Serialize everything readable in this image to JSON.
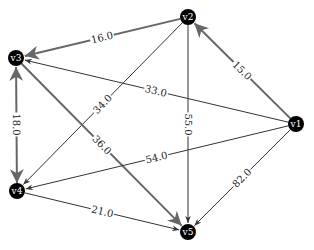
{
  "diagram": {
    "type": "directed-weighted-graph",
    "colors": {
      "node_fill": "#000000",
      "node_text": "#ffffff",
      "thin_edge": "#333333",
      "thick_edge": "#666666",
      "label_bg": "#ffffff"
    },
    "nodes": [
      {
        "id": "v1",
        "label": "v1",
        "x": 296,
        "y": 124
      },
      {
        "id": "v2",
        "label": "v2",
        "x": 188,
        "y": 17
      },
      {
        "id": "v3",
        "label": "v3",
        "x": 16,
        "y": 58
      },
      {
        "id": "v4",
        "label": "v4",
        "x": 17,
        "y": 191
      },
      {
        "id": "v5",
        "label": "v5",
        "x": 188,
        "y": 232
      }
    ],
    "edges": [
      {
        "from": "v2",
        "to": "v3",
        "weight": "16.0",
        "style": "thick"
      },
      {
        "from": "v1",
        "to": "v2",
        "weight": "15.0",
        "style": "thick"
      },
      {
        "from": "v1",
        "to": "v3",
        "weight": "33.0",
        "style": "thin"
      },
      {
        "from": "v2",
        "to": "v4",
        "weight": "34.0",
        "style": "thin"
      },
      {
        "from": "v3",
        "to": "v5",
        "weight": "36.0",
        "style": "thick"
      },
      {
        "from": "v2",
        "to": "v5",
        "weight": "55.0",
        "style": "thin"
      },
      {
        "from": "v1",
        "to": "v4",
        "weight": "54.0",
        "style": "thin"
      },
      {
        "from": "v1",
        "to": "v5",
        "weight": "82.0",
        "style": "thin"
      },
      {
        "from": "v4",
        "to": "v5",
        "weight": "21.0",
        "style": "thin"
      },
      {
        "from": "v4",
        "to": "v3",
        "weight": "18.0",
        "style": "thick",
        "bidirectional": true
      }
    ]
  }
}
